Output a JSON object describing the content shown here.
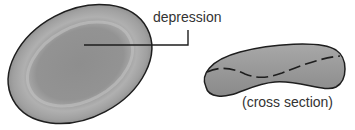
{
  "figure": {
    "labels": {
      "depression": "depression",
      "cross_section": "(cross section)"
    },
    "views": [
      {
        "name": "top view",
        "shape": "oval disc with central depression"
      },
      {
        "name": "cross section",
        "shape": "biconcave profile"
      }
    ],
    "colors": {
      "cell_fill": "#8c8c8c",
      "cell_highlight": "#b5b5b5",
      "outline": "#1e1e1e",
      "label_text": "#333333",
      "leader_line": "#1e1e1e"
    }
  }
}
